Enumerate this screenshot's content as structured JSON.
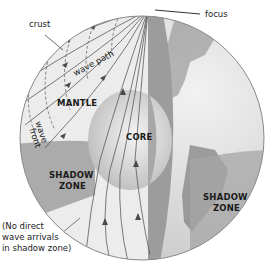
{
  "diagram": {
    "type": "cutaway-earth",
    "colors": {
      "background": "#ffffff",
      "mantle": "#e9e9e9",
      "shadow_zone": "#a9a9a9",
      "core": "#d8d8d8",
      "cut_face": "#9e9e9e",
      "globe_surface": "#dcdcdc",
      "continent": "#8f8f8f",
      "line": "#555555"
    },
    "labels": {
      "crust": "crust",
      "focus": "focus",
      "wave_path": "wave path",
      "mantle": "MANTLE",
      "wave": "wave",
      "front": "front",
      "core": "CORE",
      "shadow_zone_left_1": "SHADOW",
      "shadow_zone_left_2": "ZONE",
      "shadow_zone_right_1": "SHADOW",
      "shadow_zone_right_2": "ZONE",
      "note": "(No direct\nwave arrivals\nin shadow zone)"
    }
  }
}
